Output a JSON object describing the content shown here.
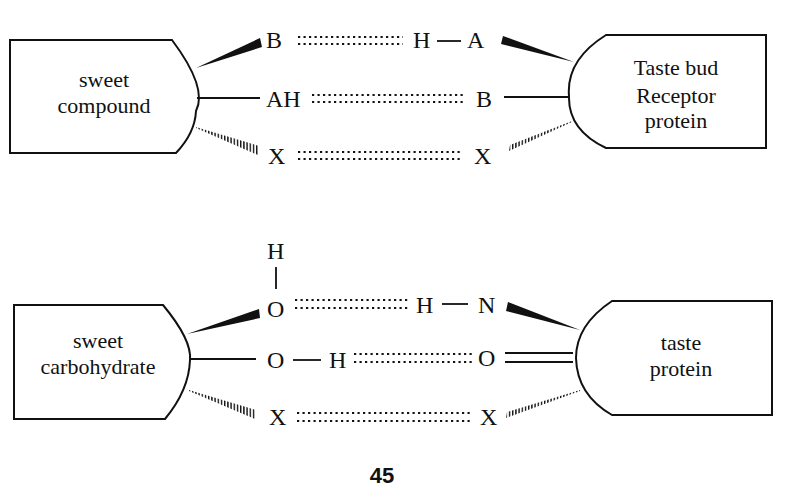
{
  "figure": {
    "page_number": "45"
  },
  "top_diagram": {
    "left_box": {
      "line1": "sweet",
      "line2": "compound"
    },
    "right_box": {
      "line1": "Taste bud",
      "line2": "Receptor",
      "line3": "protein"
    },
    "rows": [
      {
        "left_atom": "B",
        "h_atom": "H",
        "right_atom": "A",
        "left_bond": "wedge",
        "right_bond": "wedge",
        "interaction": "hydrogen bond"
      },
      {
        "left_atom": "AH",
        "right_atom": "B",
        "left_bond": "single",
        "right_bond": "single",
        "interaction": "hydrogen bond"
      },
      {
        "left_atom": "X",
        "right_atom": "X",
        "left_bond": "hashed",
        "right_bond": "hashed",
        "interaction": "hydrophobic"
      }
    ]
  },
  "bottom_diagram": {
    "left_box": {
      "line1": "sweet",
      "line2": "carbohydrate"
    },
    "right_box": {
      "line1": "taste",
      "line2": "protein"
    },
    "top_h": "H",
    "rows": [
      {
        "left_atom": "O",
        "h_atom": "H",
        "right_atom": "N",
        "left_bond": "wedge",
        "right_bond": "wedge"
      },
      {
        "left_atom": "O",
        "h_atom": "H",
        "right_atom": "O",
        "left_bond": "single",
        "right_bond": "double"
      },
      {
        "left_atom": "X",
        "right_atom": "X",
        "left_bond": "hashed",
        "right_bond": "hashed"
      }
    ]
  }
}
